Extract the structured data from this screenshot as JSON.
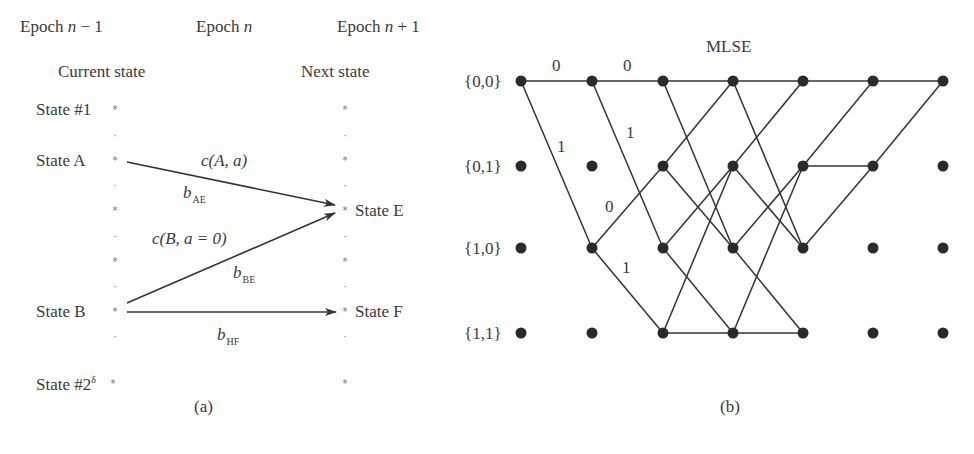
{
  "panel_a": {
    "caption": "(a)",
    "epoch_headers": [
      {
        "prefix": "Epoch ",
        "var": "n",
        "suffix": " − 1"
      },
      {
        "prefix": "Epoch ",
        "var": "n",
        "suffix": ""
      },
      {
        "prefix": "Epoch ",
        "var": "n",
        "suffix": " + 1"
      }
    ],
    "current_state_label": "Current state",
    "next_state_label": "Next state",
    "left_states": {
      "state1": "State #1",
      "stateA": "State A",
      "stateB": "State B",
      "stateLast": "State #2",
      "stateLast_sup": "δ"
    },
    "right_states": {
      "stateE": "State E",
      "stateF": "State F"
    },
    "edge_labels": {
      "cAa": "c(A, a)",
      "bAE_base": "b",
      "bAE_sub": "AE",
      "cBa0": "c(B, a = 0)",
      "bBE_base": "b",
      "bBE_sub": "BE",
      "bHF_base": "b",
      "bHF_sub": "HF"
    },
    "column_marks": [
      "*",
      "·",
      "*",
      "·",
      "*",
      "·",
      "*",
      "·",
      "*",
      "·",
      "*"
    ]
  },
  "panel_b": {
    "title": "MLSE",
    "caption": "(b)",
    "row_labels": [
      "{0,0}",
      "{0,1}",
      "{1,0}",
      "{1,1}"
    ],
    "branch_labels": [
      {
        "text": "0",
        "x": 557,
        "y": 66
      },
      {
        "text": "0",
        "x": 628,
        "y": 66
      },
      {
        "text": "1",
        "x": 562,
        "y": 147
      },
      {
        "text": "1",
        "x": 631,
        "y": 133
      },
      {
        "text": "0",
        "x": 610,
        "y": 207
      },
      {
        "text": "1",
        "x": 627,
        "y": 268
      }
    ],
    "columns_x": [
      521,
      592,
      663,
      733,
      803,
      873,
      943
    ],
    "rows_y": [
      81,
      166,
      248,
      333
    ],
    "edges": [
      [
        0,
        0,
        0
      ],
      [
        0,
        0,
        2
      ],
      [
        1,
        0,
        0
      ],
      [
        1,
        0,
        2
      ],
      [
        1,
        2,
        1
      ],
      [
        1,
        2,
        3
      ],
      [
        2,
        0,
        0
      ],
      [
        2,
        0,
        2
      ],
      [
        2,
        1,
        0
      ],
      [
        2,
        1,
        2
      ],
      [
        2,
        2,
        1
      ],
      [
        2,
        2,
        3
      ],
      [
        2,
        3,
        1
      ],
      [
        2,
        3,
        3
      ],
      [
        3,
        0,
        0
      ],
      [
        3,
        0,
        2
      ],
      [
        3,
        1,
        0
      ],
      [
        3,
        1,
        2
      ],
      [
        3,
        2,
        1
      ],
      [
        3,
        2,
        3
      ],
      [
        3,
        3,
        1
      ],
      [
        3,
        3,
        3
      ],
      [
        4,
        0,
        0
      ],
      [
        4,
        1,
        0
      ],
      [
        4,
        1,
        1
      ],
      [
        4,
        2,
        1
      ],
      [
        5,
        0,
        0
      ],
      [
        5,
        1,
        0
      ]
    ]
  },
  "colors": {
    "line": "#333333",
    "node": "#2a2a2a",
    "text": "#3a3a3a",
    "mark": "#888888"
  }
}
